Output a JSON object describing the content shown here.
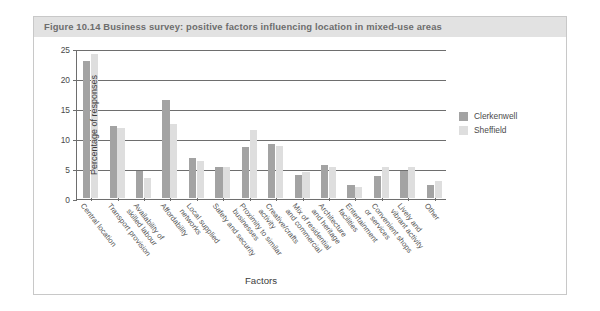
{
  "figure": {
    "caption": "Figure 10.14  Business survey: positive factors influencing location in mixed-use areas"
  },
  "legend": {
    "position": "right",
    "entries": [
      {
        "label": "Clerkenwell",
        "color": "#a3a3a3"
      },
      {
        "label": "Sheffield",
        "color": "#dedede"
      }
    ]
  },
  "axes": {
    "y_title": "Percentage of responses",
    "x_title": "Factors",
    "y_ticks": [
      "0",
      "5",
      "10",
      "15",
      "20",
      "25"
    ]
  },
  "chart_data": {
    "type": "bar",
    "title": "Figure 10.14  Business survey: positive factors influencing location in mixed-use areas",
    "xlabel": "Factors",
    "ylabel": "Percentage of responses",
    "ylim": [
      0,
      25
    ],
    "yticks": [
      0,
      5,
      10,
      15,
      20,
      25
    ],
    "grid": true,
    "legend_position": "right",
    "categories": [
      "Central location",
      "Transport provision",
      "Availability of skilled labour",
      "Affordability",
      "Local supplied networks",
      "Safety and security",
      "Proximity to similar businesses",
      "Creative/crafts activity",
      "Mix of residential and commercial",
      "Architecture and heritage",
      "Entertainment facilities",
      "Convenient shops or services",
      "Lively and vibrant activity",
      "Other"
    ],
    "category_lines": [
      [
        "Central location"
      ],
      [
        "Transport provision"
      ],
      [
        "Availability of",
        "skilled labour"
      ],
      [
        "Affordability"
      ],
      [
        "Local supplied",
        "networks"
      ],
      [
        "Safety and security"
      ],
      [
        "Proximity to similar",
        "businesses"
      ],
      [
        "Creative/crafts",
        "activity"
      ],
      [
        "Mix of residential",
        "and commercial"
      ],
      [
        "Architecture",
        "and heritage"
      ],
      [
        "Entertainment",
        "facilities"
      ],
      [
        "Convenient shops",
        "or services"
      ],
      [
        "Lively and",
        "vibrant activity"
      ],
      [
        "Other"
      ]
    ],
    "series": [
      {
        "name": "Clerkenwell",
        "color": "#a3a3a3",
        "values": [
          22.8,
          12.0,
          4.5,
          16.3,
          6.6,
          5.1,
          8.5,
          9.0,
          3.9,
          5.5,
          2.2,
          3.6,
          4.5,
          2.2
        ]
      },
      {
        "name": "Sheffield",
        "color": "#dedede",
        "values": [
          24.0,
          11.6,
          3.4,
          12.3,
          6.2,
          5.1,
          11.4,
          8.6,
          4.4,
          5.2,
          1.8,
          5.1,
          5.1,
          2.8
        ]
      }
    ]
  }
}
